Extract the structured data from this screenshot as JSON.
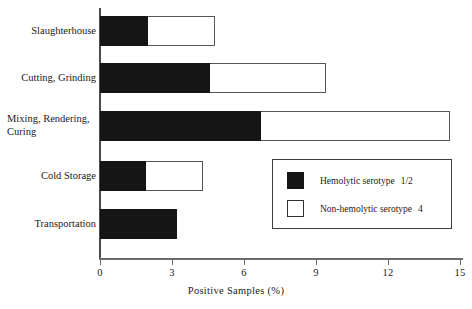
{
  "chart_data": {
    "type": "bar",
    "orientation": "horizontal",
    "stacked": true,
    "title": "",
    "xlabel": "Positive Samples (%)",
    "ylabel": "",
    "xlim": [
      0,
      15.6
    ],
    "xticks": [
      0,
      3,
      6,
      9,
      12,
      15
    ],
    "xtick_labels": [
      "0",
      "3",
      "6",
      "9",
      "12",
      "15"
    ],
    "grid": false,
    "legend_position": "inside-right",
    "categories": [
      "Slaughterhouse",
      "Cutting, Grinding",
      "Mixing, Rendering, Curing",
      "Cold Storage",
      "Transportation"
    ],
    "category_label_lines": [
      [
        "Slaughterhouse"
      ],
      [
        "Cutting, Grinding"
      ],
      [
        "Mixing, Rendering,",
        "Curing"
      ],
      [
        "Cold Storage"
      ],
      [
        "Transportation"
      ]
    ],
    "series": [
      {
        "name": "Hemolytic serotype 1/2",
        "color": "#151515",
        "values": [
          2.0,
          4.6,
          6.7,
          1.9,
          3.2
        ]
      },
      {
        "name": "Non-hemolytic serotype 4",
        "color": "#ffffff",
        "values": [
          2.8,
          4.8,
          7.9,
          2.4,
          0.0
        ]
      }
    ],
    "totals": [
      4.8,
      9.4,
      14.6,
      4.3,
      3.2
    ]
  },
  "legend": {
    "entries": [
      {
        "label": "Hemolytic serotype",
        "code": "1/2",
        "swatch": "dark"
      },
      {
        "label": "Non-hemolytic serotype",
        "code": "4",
        "swatch": "light"
      }
    ]
  },
  "colors": {
    "dark_segment": "#151515",
    "light_segment": "#ffffff",
    "outline": "#55555a",
    "axis": "#6b6b6b",
    "text": "#1a1a1a",
    "background": "#ffffff"
  }
}
